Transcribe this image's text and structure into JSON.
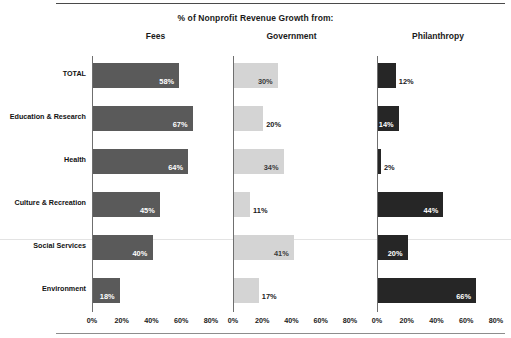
{
  "chart_data": {
    "type": "bar",
    "title": "% of Nonprofit Revenue Growth from:",
    "orientation": "horizontal",
    "layout": "small-multiples",
    "xlabel": "",
    "ylabel": "",
    "xlim": [
      0,
      80
    ],
    "xticks": [
      "0%",
      "20%",
      "40%",
      "60%",
      "80%"
    ],
    "xtick_values": [
      0,
      20,
      40,
      60,
      80
    ],
    "grid": false,
    "legend": "none",
    "categories": [
      "TOTAL",
      "Education & Research",
      "Health",
      "Culture & Recreation",
      "Social Services",
      "Environment"
    ],
    "series": [
      {
        "name": "Fees",
        "color": "#5a5a5a",
        "values": [
          58,
          67,
          64,
          45,
          40,
          18
        ],
        "labels": [
          "58%",
          "67%",
          "64%",
          "45%",
          "40%",
          "18%"
        ],
        "label_placement": [
          "inside",
          "inside",
          "inside",
          "inside",
          "inside",
          "inside"
        ]
      },
      {
        "name": "Government",
        "color": "#d4d4d4",
        "values": [
          30,
          20,
          34,
          11,
          41,
          17
        ],
        "labels": [
          "30%",
          "20%",
          "34%",
          "11%",
          "41%",
          "17%"
        ],
        "label_placement": [
          "inside",
          "outside",
          "inside",
          "outside",
          "inside",
          "outside"
        ]
      },
      {
        "name": "Philanthropy",
        "color": "#262626",
        "values": [
          12,
          14,
          2,
          44,
          20,
          66
        ],
        "labels": [
          "12%",
          "14%",
          "2%",
          "44%",
          "20%",
          "66%"
        ],
        "label_placement": [
          "outside",
          "inside",
          "outside",
          "inside",
          "inside",
          "inside"
        ]
      }
    ]
  },
  "panels": [
    {
      "title": "Fees"
    },
    {
      "title": "Government"
    },
    {
      "title": "Philanthropy"
    }
  ]
}
